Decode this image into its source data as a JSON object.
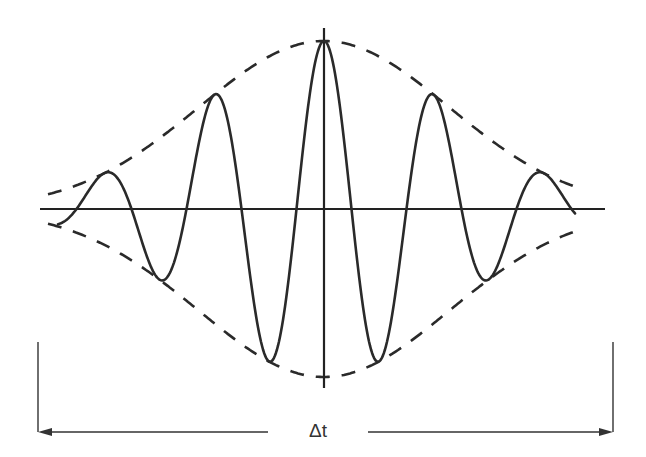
{
  "figure": {
    "interval_label": "Δt",
    "colors": {
      "line": "#2a2a2a",
      "background": "#ffffff"
    }
  },
  "geometry": {
    "center_x": 324,
    "baseline_y": 209,
    "horizontal_axis": {
      "x1": 40,
      "x2": 605
    },
    "vertical_axis": {
      "y1": 28,
      "y2": 388
    },
    "envelope": {
      "amplitude": 168,
      "sigma": 125,
      "x_start": 48,
      "x_end": 582
    },
    "carrier": {
      "half_period": 55,
      "x_start": 58,
      "x_end": 575
    },
    "bracket": {
      "x_left": 38,
      "x_right": 613,
      "y_top": 342,
      "y_arrow": 432,
      "label_x": 318,
      "label_gap": 60
    }
  }
}
